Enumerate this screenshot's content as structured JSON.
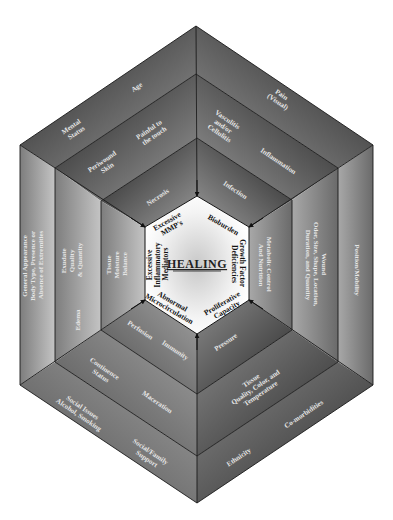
{
  "center": {
    "title": "HEALING",
    "factors": [
      {
        "id": "mmp",
        "lines": [
          "Excessive",
          "MMP's"
        ]
      },
      {
        "id": "bioburden",
        "lines": [
          "Bioburden"
        ]
      },
      {
        "id": "growth",
        "lines": [
          "Growth Factor",
          "Deficiencies"
        ]
      },
      {
        "id": "prolif",
        "lines": [
          "Proliferative",
          "Capacity"
        ]
      },
      {
        "id": "microcirc",
        "lines": [
          "Abnormal",
          "Microcirculation"
        ]
      },
      {
        "id": "inflam",
        "lines": [
          "Excessive",
          "Inflammatory",
          "Mediators"
        ]
      }
    ]
  },
  "inner_ring": {
    "labels": [
      {
        "id": "necrosis",
        "lines": [
          "Necrosis"
        ]
      },
      {
        "id": "infection",
        "lines": [
          "Infection"
        ]
      },
      {
        "id": "metabolic",
        "lines": [
          "Metabolic Control",
          "And Nutrition"
        ]
      },
      {
        "id": "pressure",
        "lines": [
          "Pressure"
        ]
      },
      {
        "id": "immunity",
        "lines": [
          "Immunity"
        ]
      },
      {
        "id": "perfusion",
        "lines": [
          "Perfusion"
        ]
      },
      {
        "id": "tissue-moisture",
        "lines": [
          "Tissue",
          "Moisture",
          "Balance"
        ]
      }
    ]
  },
  "middle_ring": {
    "labels": [
      {
        "id": "painful",
        "lines": [
          "Painful to",
          "the touch"
        ]
      },
      {
        "id": "cellulitis",
        "lines": [
          "Vasculitis",
          "and/or",
          "Cellulitis"
        ]
      },
      {
        "id": "inflammation",
        "lines": [
          "Inflammation"
        ]
      },
      {
        "id": "wound",
        "lines": [
          "Wound",
          "Odor, Size, Shape, Location,",
          "Duration, and Quantity"
        ]
      },
      {
        "id": "tissue-quality",
        "lines": [
          "Tissue",
          "Quality, Color, and",
          "Temperature"
        ]
      },
      {
        "id": "maceration",
        "lines": [
          "Maceration"
        ]
      },
      {
        "id": "continence",
        "lines": [
          "Continence",
          "Status"
        ]
      },
      {
        "id": "edema",
        "lines": [
          "Edema"
        ]
      },
      {
        "id": "exudate",
        "lines": [
          "Exudate",
          "Quality",
          "& Quantity"
        ]
      },
      {
        "id": "periwound",
        "lines": [
          "Periwound",
          "Skin"
        ]
      }
    ]
  },
  "outer_ring": {
    "labels": [
      {
        "id": "age",
        "lines": [
          "Age"
        ]
      },
      {
        "id": "mental",
        "lines": [
          "Mental",
          "Status"
        ]
      },
      {
        "id": "pain",
        "lines": [
          "Pain",
          "(Visual)"
        ]
      },
      {
        "id": "position",
        "lines": [
          "Position/Mobility"
        ]
      },
      {
        "id": "comorbidities",
        "lines": [
          "Co-morbidities"
        ]
      },
      {
        "id": "ethnicity",
        "lines": [
          "Ethnicity"
        ]
      },
      {
        "id": "social-support",
        "lines": [
          "Social/Family",
          "Support"
        ]
      },
      {
        "id": "social-issues",
        "lines": [
          "Social Issues",
          "Alcohol, Smoking"
        ]
      },
      {
        "id": "general",
        "lines": [
          "General Appearance",
          "Body Type, Presence or",
          "Absence of Extremities"
        ]
      }
    ]
  },
  "colors": {
    "dark": "#1e1e1e",
    "mid": "#7a7a7a",
    "light": "#d8d8d8",
    "inner_fill": "#ffffff",
    "label_text": "#e6e6e6",
    "core_text": "#111111"
  }
}
